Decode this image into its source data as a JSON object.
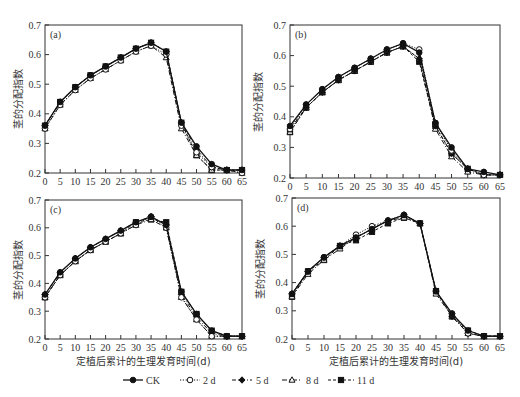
{
  "figure": {
    "ylabel": "茎的分配指数",
    "xlabel": "定植后累计的生理发育时间(d)",
    "x_ticks": [
      "0",
      "5",
      "10",
      "15",
      "20",
      "25",
      "30",
      "35",
      "40",
      "45",
      "50",
      "55",
      "60",
      "65"
    ],
    "y_ticks": [
      "0.2",
      "0.3",
      "0.4",
      "0.5",
      "0.6",
      "0.7"
    ]
  },
  "legend": [
    {
      "label": "CK",
      "marker": "filled-circle",
      "line": "solid"
    },
    {
      "label": "2 d",
      "marker": "open-circle",
      "line": "dotted"
    },
    {
      "label": "5 d",
      "marker": "filled-diamond",
      "line": "dash-dot"
    },
    {
      "label": "8 d",
      "marker": "open-triangle",
      "line": "dash-dot"
    },
    {
      "label": "11 d",
      "marker": "filled-square",
      "line": "dashed"
    }
  ],
  "chart_data": [
    {
      "type": "line",
      "panel": "(a)",
      "title": "",
      "xlabel": "",
      "ylabel": "茎的分配指数",
      "x": [
        0,
        5,
        10,
        15,
        20,
        25,
        30,
        35,
        40,
        45,
        50,
        55,
        60,
        65
      ],
      "xlim": [
        0,
        65
      ],
      "ylim": [
        0.2,
        0.7
      ],
      "grid": false,
      "series": [
        {
          "name": "CK",
          "values": [
            0.36,
            0.44,
            0.49,
            0.53,
            0.56,
            0.59,
            0.62,
            0.64,
            0.61,
            0.37,
            0.29,
            0.23,
            0.21,
            0.21
          ]
        },
        {
          "name": "2 d",
          "values": [
            0.35,
            0.43,
            0.48,
            0.52,
            0.55,
            0.58,
            0.61,
            0.63,
            0.6,
            0.36,
            0.27,
            0.22,
            0.21,
            0.2
          ]
        },
        {
          "name": "5 d",
          "values": [
            0.36,
            0.44,
            0.49,
            0.53,
            0.56,
            0.59,
            0.62,
            0.64,
            0.61,
            0.37,
            0.28,
            0.22,
            0.21,
            0.21
          ]
        },
        {
          "name": "8 d",
          "values": [
            0.35,
            0.43,
            0.48,
            0.52,
            0.55,
            0.58,
            0.61,
            0.63,
            0.59,
            0.35,
            0.26,
            0.21,
            0.21,
            0.2
          ]
        },
        {
          "name": "11 d",
          "values": [
            0.36,
            0.44,
            0.49,
            0.53,
            0.56,
            0.59,
            0.62,
            0.64,
            0.61,
            0.37,
            0.26,
            0.21,
            0.21,
            0.21
          ]
        }
      ]
    },
    {
      "type": "line",
      "panel": "(b)",
      "title": "",
      "xlabel": "",
      "ylabel": "茎的分配指数",
      "x": [
        0,
        5,
        10,
        15,
        20,
        25,
        30,
        35,
        40,
        45,
        50,
        55,
        60,
        65
      ],
      "xlim": [
        0,
        65
      ],
      "ylim": [
        0.2,
        0.7
      ],
      "grid": false,
      "series": [
        {
          "name": "CK",
          "values": [
            0.37,
            0.44,
            0.49,
            0.53,
            0.56,
            0.59,
            0.62,
            0.64,
            0.61,
            0.38,
            0.3,
            0.23,
            0.22,
            0.21
          ]
        },
        {
          "name": "2 d",
          "values": [
            0.36,
            0.44,
            0.49,
            0.53,
            0.56,
            0.59,
            0.62,
            0.64,
            0.62,
            0.38,
            0.29,
            0.23,
            0.21,
            0.21
          ]
        },
        {
          "name": "5 d",
          "values": [
            0.36,
            0.43,
            0.48,
            0.52,
            0.55,
            0.58,
            0.61,
            0.63,
            0.59,
            0.37,
            0.28,
            0.23,
            0.21,
            0.21
          ]
        },
        {
          "name": "8 d",
          "values": [
            0.35,
            0.43,
            0.48,
            0.52,
            0.55,
            0.58,
            0.61,
            0.63,
            0.59,
            0.36,
            0.27,
            0.22,
            0.21,
            0.21
          ]
        },
        {
          "name": "11 d",
          "values": [
            0.35,
            0.43,
            0.48,
            0.52,
            0.55,
            0.58,
            0.61,
            0.63,
            0.58,
            0.37,
            0.28,
            0.23,
            0.21,
            0.21
          ]
        }
      ]
    },
    {
      "type": "line",
      "panel": "(c)",
      "title": "",
      "xlabel": "定植后累计的生理发育时间(d)",
      "ylabel": "茎的分配指数",
      "x": [
        0,
        5,
        10,
        15,
        20,
        25,
        30,
        35,
        40,
        45,
        50,
        55,
        60,
        65
      ],
      "xlim": [
        0,
        65
      ],
      "ylim": [
        0.2,
        0.7
      ],
      "grid": false,
      "series": [
        {
          "name": "CK",
          "values": [
            0.36,
            0.44,
            0.49,
            0.53,
            0.56,
            0.59,
            0.62,
            0.64,
            0.61,
            0.37,
            0.29,
            0.23,
            0.21,
            0.21
          ]
        },
        {
          "name": "2 d",
          "values": [
            0.35,
            0.43,
            0.48,
            0.52,
            0.55,
            0.58,
            0.61,
            0.64,
            0.6,
            0.35,
            0.27,
            0.21,
            0.21,
            0.21
          ]
        },
        {
          "name": "5 d",
          "values": [
            0.36,
            0.44,
            0.49,
            0.53,
            0.56,
            0.59,
            0.62,
            0.64,
            0.61,
            0.36,
            0.28,
            0.22,
            0.21,
            0.21
          ]
        },
        {
          "name": "8 d",
          "values": [
            0.35,
            0.43,
            0.48,
            0.52,
            0.55,
            0.58,
            0.61,
            0.63,
            0.6,
            0.35,
            0.27,
            0.21,
            0.21,
            0.21
          ]
        },
        {
          "name": "11 d",
          "values": [
            0.35,
            0.43,
            0.48,
            0.52,
            0.55,
            0.58,
            0.62,
            0.63,
            0.62,
            0.37,
            0.29,
            0.23,
            0.21,
            0.21
          ]
        }
      ]
    },
    {
      "type": "line",
      "panel": "(d)",
      "title": "",
      "xlabel": "定植后累计的生理发育时间(d)",
      "ylabel": "茎的分配指数",
      "x": [
        0,
        5,
        10,
        15,
        20,
        25,
        30,
        35,
        40,
        45,
        50,
        55,
        60,
        65
      ],
      "xlim": [
        0,
        65
      ],
      "ylim": [
        0.2,
        0.7
      ],
      "grid": false,
      "series": [
        {
          "name": "CK",
          "values": [
            0.36,
            0.44,
            0.49,
            0.53,
            0.56,
            0.59,
            0.62,
            0.64,
            0.61,
            0.37,
            0.29,
            0.23,
            0.21,
            0.21
          ]
        },
        {
          "name": "2 d",
          "values": [
            0.36,
            0.44,
            0.49,
            0.53,
            0.57,
            0.6,
            0.62,
            0.64,
            0.61,
            0.37,
            0.29,
            0.22,
            0.21,
            0.21
          ]
        },
        {
          "name": "5 d",
          "values": [
            0.36,
            0.44,
            0.49,
            0.53,
            0.56,
            0.59,
            0.62,
            0.64,
            0.61,
            0.37,
            0.28,
            0.22,
            0.21,
            0.21
          ]
        },
        {
          "name": "8 d",
          "values": [
            0.35,
            0.43,
            0.48,
            0.52,
            0.56,
            0.59,
            0.62,
            0.63,
            0.61,
            0.36,
            0.28,
            0.22,
            0.21,
            0.21
          ]
        },
        {
          "name": "11 d",
          "values": [
            0.35,
            0.44,
            0.48,
            0.53,
            0.55,
            0.58,
            0.61,
            0.63,
            0.61,
            0.37,
            0.28,
            0.23,
            0.21,
            0.21
          ]
        }
      ]
    }
  ]
}
